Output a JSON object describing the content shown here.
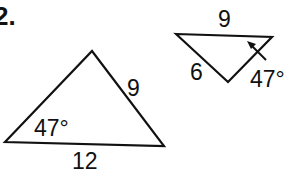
{
  "problem": {
    "number_label": "2."
  },
  "triangle_left": {
    "side_right_label": "9",
    "side_bottom_label": "12",
    "angle_label": "47°"
  },
  "triangle_right": {
    "side_top_label": "9",
    "side_left_label": "6",
    "angle_label": "47°"
  },
  "colors": {
    "stroke": "#111111",
    "background": "#ffffff"
  }
}
